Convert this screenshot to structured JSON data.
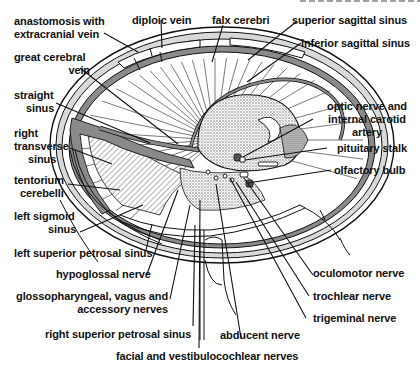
{
  "figure": {
    "type": "anatomical line drawing",
    "header_partial": "",
    "colors": {
      "ink": "#111111",
      "background": "#ffffff",
      "dura_gray": "#8a8a8a",
      "bone_light": "#d9d9d9",
      "stipple": "#bdbdbd"
    }
  },
  "labels": {
    "anastomosis": [
      "anastomosis with",
      "extracranial vein"
    ],
    "diploic_vein": "diploic vein",
    "falx_cerebri": "falx cerebri",
    "superior_sagittal_sinus": "superior sagittal sinus",
    "inferior_sagittal_sinus": "inferior sagittal sinus",
    "great_cerebral_vein": [
      "great cerebral",
      "vein"
    ],
    "straight_sinus": [
      "straight",
      "sinus"
    ],
    "right_transverse_sinus": [
      "right",
      "transverse",
      "sinus"
    ],
    "tentorium_cerebelli": [
      "tentorium",
      "cerebelli"
    ],
    "left_sigmoid_sinus": [
      "left sigmoid",
      "sinus"
    ],
    "left_superior_petrosal_sinus": "left superior petrosal sinus",
    "hypoglossal_nerve": "hypoglossal nerve",
    "glossopharyngeal": [
      "glossopharyngeal, vagus and",
      "accessory nerves"
    ],
    "right_superior_petrosal_sinus": "right superior petrosal sinus",
    "facial_vestibulocochlear": "facial and vestibulocochlear nerves",
    "abducent_nerve": "abducent nerve",
    "trigeminal_nerve": "trigeminal nerve",
    "trochlear_nerve": "trochlear nerve",
    "oculomotor_nerve": "oculomotor nerve",
    "olfactory_bulb": "olfactory bulb",
    "pituitary_stalk": "pituitary stalk",
    "optic_nerve": [
      "optic nerve and",
      "internal carotid",
      "artery"
    ]
  }
}
